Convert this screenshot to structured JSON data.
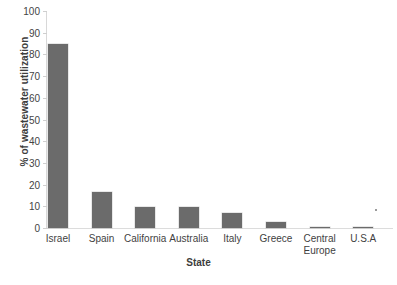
{
  "chart_data": {
    "type": "bar",
    "title": "",
    "xlabel": "State",
    "ylabel": "% of wastewater utilization",
    "categories": [
      "Israel",
      "Spain",
      "California",
      "Australia",
      "Italy",
      "Greece",
      "Central Europe",
      "U.S.A"
    ],
    "values": [
      85,
      16.5,
      9.5,
      9.5,
      7,
      3,
      0.5,
      0.5
    ],
    "ylim": [
      0,
      100
    ],
    "yticks": [
      0,
      10,
      20,
      30,
      40,
      50,
      60,
      70,
      80,
      90,
      100
    ],
    "ytick_labels": [
      "0",
      "10",
      "20",
      "30",
      "40",
      "50",
      "60",
      "70",
      "80",
      "90",
      "100"
    ],
    "grid": false,
    "legend": null,
    "bar_color": "#6b6b6b",
    "series": [
      {
        "name": "% of wastewater utilization",
        "values": [
          85,
          16.5,
          9.5,
          9.5,
          7,
          3,
          0.5,
          0.5
        ]
      }
    ]
  },
  "axis": {
    "x_title": "State",
    "y_title": "% of wastewater utilization"
  },
  "colors": {
    "bar": "#6b6b6b",
    "axis": "#d8d8d8",
    "text": "#3a3a3a"
  }
}
